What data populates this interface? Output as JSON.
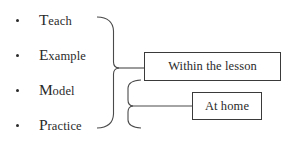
{
  "diagram": {
    "background_color": "#ffffff",
    "line_color": "#3a3a3a",
    "text_color": "#2a2a2a",
    "bullets": [
      {
        "initial": "T",
        "rest": "each",
        "full": "Teach"
      },
      {
        "initial": "E",
        "rest": "xample",
        "full": "Example"
      },
      {
        "initial": "M",
        "rest": "odel",
        "full": "Model"
      },
      {
        "initial": "P",
        "rest": "ractice",
        "full": "Practice"
      }
    ],
    "boxes": [
      {
        "id": "lesson",
        "label": "Within the lesson"
      },
      {
        "id": "home",
        "label": "At home"
      }
    ],
    "connectors": [
      {
        "name": "outer-bracket",
        "spans": [
          "Teach",
          "Example",
          "Model",
          "Practice"
        ],
        "target": "Within the lesson"
      },
      {
        "name": "inner-bracket",
        "spans": [
          "Model",
          "Practice"
        ],
        "target": "At home"
      }
    ]
  }
}
